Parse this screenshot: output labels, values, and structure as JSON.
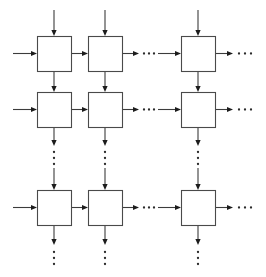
{
  "figure": {
    "type": "block-diagram",
    "canvas": {
      "width": 266,
      "height": 277,
      "background": "#ffffff"
    },
    "style": {
      "box_stroke": "#4a4a4a",
      "box_fill": "#ffffff",
      "line_stroke": "#3c3c3c",
      "arrow_fill": "#1c1c1c",
      "dot_fill": "#2b2b2b",
      "line_width": 1.1,
      "arrow_length": 6,
      "arrow_half_width": 2.6,
      "dot_radius": 1.15
    },
    "grid": {
      "rows": 3,
      "cols": 3,
      "box_width": 34,
      "box_height": 35,
      "col_x": [
        37,
        88,
        181
      ],
      "row_y": [
        36,
        92,
        190
      ],
      "col_center_x": [
        54,
        105,
        198
      ],
      "row_center_y": [
        53.5,
        109.5,
        207.5
      ]
    },
    "boxes": [
      {
        "id": "cell-r1c1",
        "row": 1,
        "col": 1,
        "x": 37,
        "y": 36,
        "w": 34,
        "h": 35
      },
      {
        "id": "cell-r1c2",
        "row": 1,
        "col": 2,
        "x": 88,
        "y": 36,
        "w": 34,
        "h": 35
      },
      {
        "id": "cell-r1c3",
        "row": 1,
        "col": 3,
        "x": 181,
        "y": 36,
        "w": 34,
        "h": 35
      },
      {
        "id": "cell-r2c1",
        "row": 2,
        "col": 1,
        "x": 37,
        "y": 92,
        "w": 34,
        "h": 35
      },
      {
        "id": "cell-r2c2",
        "row": 2,
        "col": 2,
        "x": 88,
        "y": 92,
        "w": 34,
        "h": 35
      },
      {
        "id": "cell-r2c3",
        "row": 2,
        "col": 3,
        "x": 181,
        "y": 92,
        "w": 34,
        "h": 35
      },
      {
        "id": "cell-r3c1",
        "row": 3,
        "col": 1,
        "x": 37,
        "y": 190,
        "w": 34,
        "h": 35
      },
      {
        "id": "cell-r3c2",
        "row": 3,
        "col": 2,
        "x": 88,
        "y": 190,
        "w": 34,
        "h": 35
      },
      {
        "id": "cell-r3c3",
        "row": 3,
        "col": 3,
        "x": 181,
        "y": 190,
        "w": 34,
        "h": 35
      }
    ],
    "arrows": [
      {
        "id": "top-in-c1",
        "kind": "vertical-down",
        "x": 54,
        "y1": 10,
        "y2": 36,
        "head": true
      },
      {
        "id": "top-in-c2",
        "kind": "vertical-down",
        "x": 105,
        "y1": 10,
        "y2": 36,
        "head": true
      },
      {
        "id": "top-in-c3",
        "kind": "vertical-down",
        "x": 198,
        "y1": 10,
        "y2": 36,
        "head": true
      },
      {
        "id": "left-in-r1",
        "kind": "horizontal-right",
        "y": 53.5,
        "x1": 13,
        "x2": 37,
        "head": true
      },
      {
        "id": "left-in-r2",
        "kind": "horizontal-right",
        "y": 109.5,
        "x1": 13,
        "x2": 37,
        "head": true
      },
      {
        "id": "left-in-r3",
        "kind": "horizontal-right",
        "y": 207.5,
        "x1": 13,
        "x2": 37,
        "head": true
      },
      {
        "id": "h-r1-c1c2",
        "kind": "horizontal-right",
        "y": 53.5,
        "x1": 71,
        "x2": 88,
        "head": true
      },
      {
        "id": "h-r2-c1c2",
        "kind": "horizontal-right",
        "y": 109.5,
        "x1": 71,
        "x2": 88,
        "head": true
      },
      {
        "id": "h-r3-c1c2",
        "kind": "horizontal-right",
        "y": 207.5,
        "x1": 71,
        "x2": 88,
        "head": true
      },
      {
        "id": "h-r1-c2-out",
        "kind": "horizontal-right",
        "y": 53.5,
        "x1": 122,
        "x2": 139,
        "head": true
      },
      {
        "id": "h-r2-c2-out",
        "kind": "horizontal-right",
        "y": 109.5,
        "x1": 122,
        "x2": 139,
        "head": true
      },
      {
        "id": "h-r3-c2-out",
        "kind": "horizontal-right",
        "y": 207.5,
        "x1": 122,
        "x2": 139,
        "head": true
      },
      {
        "id": "h-r1-c3-in",
        "kind": "horizontal-right",
        "y": 53.5,
        "x1": 158,
        "x2": 181,
        "head": true
      },
      {
        "id": "h-r2-c3-in",
        "kind": "horizontal-right",
        "y": 109.5,
        "x1": 158,
        "x2": 181,
        "head": true
      },
      {
        "id": "h-r3-c3-in",
        "kind": "horizontal-right",
        "y": 207.5,
        "x1": 158,
        "x2": 181,
        "head": true
      },
      {
        "id": "h-r1-c3-out",
        "kind": "horizontal-right",
        "y": 53.5,
        "x1": 215,
        "x2": 233,
        "head": true
      },
      {
        "id": "h-r2-c3-out",
        "kind": "horizontal-right",
        "y": 109.5,
        "x1": 215,
        "x2": 233,
        "head": true
      },
      {
        "id": "h-r3-c3-out",
        "kind": "horizontal-right",
        "y": 207.5,
        "x1": 215,
        "x2": 233,
        "head": true
      },
      {
        "id": "v-c1-r1r2",
        "kind": "vertical-down",
        "x": 54,
        "y1": 71,
        "y2": 92,
        "head": true
      },
      {
        "id": "v-c2-r1r2",
        "kind": "vertical-down",
        "x": 105,
        "y1": 71,
        "y2": 92,
        "head": true
      },
      {
        "id": "v-c3-r1r2",
        "kind": "vertical-down",
        "x": 198,
        "y1": 71,
        "y2": 92,
        "head": true
      },
      {
        "id": "v-c1-r2-out",
        "kind": "vertical-down",
        "x": 54,
        "y1": 127,
        "y2": 146,
        "head": true
      },
      {
        "id": "v-c2-r2-out",
        "kind": "vertical-down",
        "x": 105,
        "y1": 127,
        "y2": 146,
        "head": true
      },
      {
        "id": "v-c3-r2-out",
        "kind": "vertical-down",
        "x": 198,
        "y1": 127,
        "y2": 146,
        "head": true
      },
      {
        "id": "v-c1-r3-in",
        "kind": "vertical-down",
        "x": 54,
        "y1": 168,
        "y2": 190,
        "head": true
      },
      {
        "id": "v-c2-r3-in",
        "kind": "vertical-down",
        "x": 105,
        "y1": 168,
        "y2": 190,
        "head": true
      },
      {
        "id": "v-c3-r3-in",
        "kind": "vertical-down",
        "x": 198,
        "y1": 168,
        "y2": 190,
        "head": true
      },
      {
        "id": "v-c1-r3-out",
        "kind": "vertical-down",
        "x": 54,
        "y1": 225,
        "y2": 245,
        "head": true
      },
      {
        "id": "v-c2-r3-out",
        "kind": "vertical-down",
        "x": 105,
        "y1": 225,
        "y2": 245,
        "head": true
      },
      {
        "id": "v-c3-r3-out",
        "kind": "vertical-down",
        "x": 198,
        "y1": 225,
        "y2": 245,
        "head": true
      }
    ],
    "ellipses": [
      {
        "id": "ell-h-r1-mid",
        "kind": "horizontal",
        "label": "horizontal-continuation-row-1",
        "y": 53.5,
        "xs": [
          144,
          149,
          154
        ]
      },
      {
        "id": "ell-h-r2-mid",
        "kind": "horizontal",
        "label": "horizontal-continuation-row-2",
        "y": 109.5,
        "xs": [
          144,
          149,
          154
        ]
      },
      {
        "id": "ell-h-r3-mid",
        "kind": "horizontal",
        "label": "horizontal-continuation-row-3",
        "y": 207.5,
        "xs": [
          144,
          149,
          154
        ]
      },
      {
        "id": "ell-h-r1-end",
        "kind": "horizontal",
        "label": "horizontal-continuation-row-1-right",
        "y": 53.5,
        "xs": [
          239,
          245,
          251
        ]
      },
      {
        "id": "ell-h-r2-end",
        "kind": "horizontal",
        "label": "horizontal-continuation-row-2-right",
        "y": 109.5,
        "xs": [
          239,
          245,
          251
        ]
      },
      {
        "id": "ell-h-r3-end",
        "kind": "horizontal",
        "label": "horizontal-continuation-row-3-right",
        "y": 207.5,
        "xs": [
          239,
          245,
          251
        ]
      },
      {
        "id": "ell-v-c1-mid",
        "kind": "vertical",
        "label": "vertical-continuation-col-1",
        "x": 54,
        "ys": [
          152,
          158,
          164
        ]
      },
      {
        "id": "ell-v-c2-mid",
        "kind": "vertical",
        "label": "vertical-continuation-col-2",
        "x": 105,
        "ys": [
          152,
          158,
          164
        ]
      },
      {
        "id": "ell-v-c3-mid",
        "kind": "vertical",
        "label": "vertical-continuation-col-3",
        "x": 198,
        "ys": [
          152,
          158,
          164
        ]
      },
      {
        "id": "ell-v-c1-end",
        "kind": "vertical",
        "label": "vertical-continuation-col-1-bottom",
        "x": 54,
        "ys": [
          252,
          258,
          264
        ]
      },
      {
        "id": "ell-v-c2-end",
        "kind": "vertical",
        "label": "vertical-continuation-col-2-bottom",
        "x": 105,
        "ys": [
          252,
          258,
          264
        ]
      },
      {
        "id": "ell-v-c3-end",
        "kind": "vertical",
        "label": "vertical-continuation-col-3-bottom",
        "x": 198,
        "ys": [
          252,
          258,
          264
        ]
      }
    ]
  }
}
